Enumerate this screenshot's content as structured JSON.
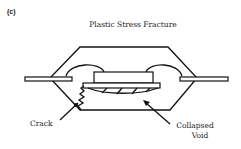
{
  "figure": {
    "panel_label": "(c)",
    "title": "Plastic Stress Fracture",
    "labels": {
      "crack": "Crack",
      "collapsed_void_line1": "Collapsed",
      "collapsed_void_line2": "Void"
    },
    "components": [
      "plastic package body",
      "left lead",
      "right lead",
      "die",
      "die pad",
      "bond wires",
      "crack",
      "collapsed void"
    ]
  }
}
